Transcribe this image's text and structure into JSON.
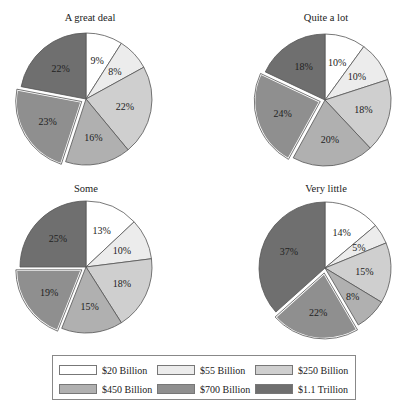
{
  "chart_data": [
    {
      "type": "pie",
      "title": "A great deal",
      "categories": [
        "$20 Billion",
        "$55 Billion",
        "$250 Billion",
        "$450 Billion",
        "$700 Billion",
        "$1.1 Trillion"
      ],
      "values": [
        9,
        8,
        22,
        16,
        23,
        22
      ],
      "labels": [
        "9%",
        "8%",
        "22%",
        "16%",
        "23%",
        "22%"
      ],
      "exploded_index": 4,
      "center": [
        86,
        99
      ],
      "radius": 66,
      "title_pos": [
        20,
        13
      ]
    },
    {
      "type": "pie",
      "title": "Quite a lot",
      "categories": [
        "$20 Billion",
        "$55 Billion",
        "$250 Billion",
        "$450 Billion",
        "$700 Billion",
        "$1.1 Trillion"
      ],
      "values": [
        10,
        10,
        18,
        20,
        24,
        18
      ],
      "labels": [
        "10%",
        "10%",
        "18%",
        "20%",
        "24%",
        "18%"
      ],
      "exploded_index": 4,
      "center": [
        325,
        100
      ],
      "radius": 66,
      "title_pos": [
        256,
        13
      ]
    },
    {
      "type": "pie",
      "title": "Some",
      "categories": [
        "$20 Billion",
        "$55 Billion",
        "$250 Billion",
        "$450 Billion",
        "$700 Billion",
        "$1.1 Trillion"
      ],
      "values": [
        13,
        10,
        18,
        15,
        19,
        25
      ],
      "labels": [
        "13%",
        "10%",
        "18%",
        "15%",
        "19%",
        "25%"
      ],
      "exploded_index": 4,
      "center": [
        86,
        267
      ],
      "radius": 66,
      "title_pos": [
        20,
        185
      ]
    },
    {
      "type": "pie",
      "title": "Very little",
      "categories": [
        "$20 Billion",
        "$55 Billion",
        "$250 Billion",
        "$450 Billion",
        "$700 Billion",
        "$1.1 Trillion"
      ],
      "values": [
        14,
        5,
        15,
        8,
        22,
        37
      ],
      "labels": [
        "14%",
        "5%",
        "15%",
        "8%",
        "22%",
        "37%"
      ],
      "exploded_index": 4,
      "center": [
        325,
        268
      ],
      "radius": 66,
      "title_pos": [
        256,
        185
      ]
    }
  ],
  "legend": {
    "items": [
      {
        "label": "$20 Billion",
        "color": "#ffffff"
      },
      {
        "label": "$55 Billion",
        "color": "#ececec"
      },
      {
        "label": "$250 Billion",
        "color": "#cfcfcf"
      },
      {
        "label": "$450 Billion",
        "color": "#b0b0b0"
      },
      {
        "label": "$700 Billion",
        "color": "#8f8f8f"
      },
      {
        "label": "$1.1 Trillion",
        "color": "#6f6f6f"
      }
    ]
  },
  "titles": {
    "pie1": "A great deal",
    "pie2": "Quite a lot",
    "pie3": "Some",
    "pie4": "Very little"
  }
}
